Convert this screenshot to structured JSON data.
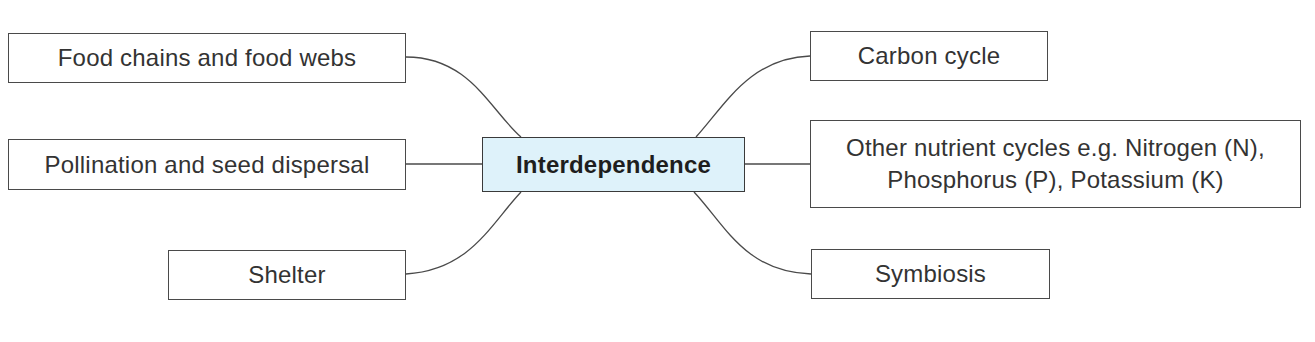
{
  "diagram": {
    "type": "mind-map",
    "center": {
      "label": "Interdependence",
      "fill": "#def2fa"
    },
    "left_nodes": [
      {
        "label": "Food chains and food webs"
      },
      {
        "label": "Pollination and seed dispersal"
      },
      {
        "label": "Shelter"
      }
    ],
    "right_nodes": [
      {
        "label": "Carbon cycle"
      },
      {
        "label": "Other nutrient cycles e.g. Nitrogen (N), Phosphorus (P), Potassium (K)"
      },
      {
        "label": "Symbiosis"
      }
    ],
    "line_color": "#4a4a4a"
  }
}
